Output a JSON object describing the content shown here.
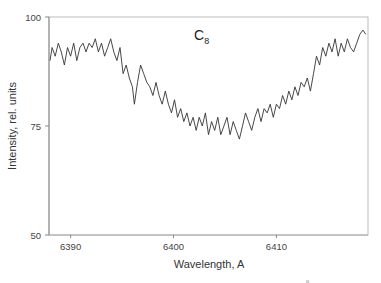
{
  "chart_data": {
    "type": "line",
    "title": "",
    "panel_label": "C",
    "panel_label_sub": "8",
    "xlabel": "Wavelength, A",
    "ylabel": "Intensity, rel. units",
    "xlim": [
      6387.9,
      6418.9
    ],
    "ylim": [
      50,
      100
    ],
    "xticks": [
      6390,
      6400,
      6410
    ],
    "yticks": [
      50,
      75,
      100
    ],
    "xtick_labels": [
      "6390",
      "6400",
      "6410"
    ],
    "ytick_labels": [
      "50",
      "75",
      "100"
    ],
    "grid": false,
    "legend": null,
    "line_color": "#333333",
    "series": [
      {
        "name": "spectrum",
        "x": [
          6388.0,
          6388.2,
          6388.5,
          6388.8,
          6389.1,
          6389.4,
          6389.7,
          6390.0,
          6390.3,
          6390.6,
          6390.9,
          6391.2,
          6391.5,
          6391.8,
          6392.1,
          6392.4,
          6392.7,
          6393.0,
          6393.3,
          6393.6,
          6393.9,
          6394.2,
          6394.5,
          6394.8,
          6395.1,
          6395.4,
          6395.7,
          6396.0,
          6396.2,
          6396.5,
          6396.8,
          6397.1,
          6397.4,
          6397.7,
          6398.0,
          6398.3,
          6398.6,
          6398.9,
          6399.2,
          6399.5,
          6399.8,
          6400.1,
          6400.4,
          6400.7,
          6401.0,
          6401.3,
          6401.6,
          6401.9,
          6402.2,
          6402.5,
          6402.8,
          6403.1,
          6403.4,
          6403.7,
          6404.0,
          6404.3,
          6404.6,
          6404.9,
          6405.2,
          6405.5,
          6405.8,
          6406.1,
          6406.4,
          6406.7,
          6407.0,
          6407.3,
          6407.6,
          6407.9,
          6408.2,
          6408.5,
          6408.8,
          6409.1,
          6409.4,
          6409.7,
          6410.0,
          6410.3,
          6410.6,
          6410.9,
          6411.2,
          6411.5,
          6411.8,
          6412.1,
          6412.4,
          6412.7,
          6413.0,
          6413.3,
          6413.6,
          6413.9,
          6414.2,
          6414.5,
          6414.8,
          6415.1,
          6415.4,
          6415.7,
          6416.0,
          6416.3,
          6416.6,
          6416.9,
          6417.2,
          6417.5,
          6417.8,
          6418.1,
          6418.4,
          6418.7
        ],
        "values": [
          90,
          93,
          91,
          94,
          92,
          89,
          93,
          91,
          94,
          90,
          93,
          94,
          92,
          94,
          93,
          95,
          92,
          94,
          91,
          93,
          95,
          92,
          90,
          93,
          87,
          89,
          86,
          84,
          80,
          85,
          89,
          87,
          85,
          84,
          82,
          85,
          82,
          80,
          83,
          80,
          78,
          81,
          77,
          79,
          76,
          78,
          75,
          77,
          74,
          77,
          75,
          78,
          73,
          76,
          74,
          77,
          73,
          75,
          77,
          73,
          76,
          74,
          72,
          75,
          78,
          76,
          74,
          77,
          79,
          76,
          79,
          78,
          80,
          77,
          80,
          79,
          82,
          80,
          83,
          81,
          84,
          82,
          85,
          84,
          86,
          83,
          87,
          91,
          89,
          93,
          91,
          94,
          92,
          95,
          91,
          94,
          92,
          95,
          93,
          92,
          94,
          96,
          97,
          96
        ]
      }
    ]
  },
  "footnote_mark": "o"
}
